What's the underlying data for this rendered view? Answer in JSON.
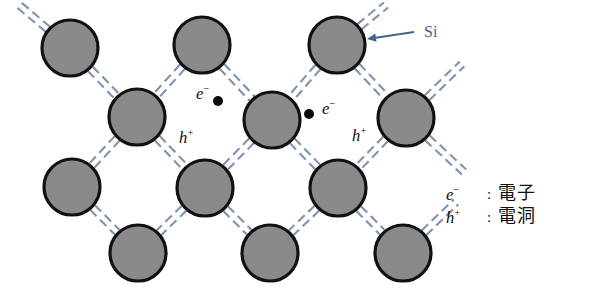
{
  "figure": {
    "background_color": "#ffffff"
  },
  "colors": {
    "atom_fill": "#8a8a8a",
    "atom_stroke": "#111111",
    "bond": "#7e92b4",
    "carrier_dot": "#0b0b0b",
    "annotation_blue": "#46638f",
    "text": "#101010"
  },
  "lattice": {
    "atom_radius": 28,
    "atoms": [
      {
        "id": "a1",
        "cx": 70,
        "cy": 48,
        "row": 1
      },
      {
        "id": "a2",
        "cx": 202,
        "cy": 45,
        "row": 1
      },
      {
        "id": "a3",
        "cx": 337,
        "cy": 45,
        "row": 1
      },
      {
        "id": "b1",
        "cx": 137,
        "cy": 117,
        "row": 2
      },
      {
        "id": "b2",
        "cx": 272,
        "cy": 120,
        "row": 2
      },
      {
        "id": "b3",
        "cx": 406,
        "cy": 118,
        "row": 2
      },
      {
        "id": "c1",
        "cx": 72,
        "cy": 187,
        "row": 3
      },
      {
        "id": "c2",
        "cx": 205,
        "cy": 188,
        "row": 3
      },
      {
        "id": "c3",
        "cx": 338,
        "cy": 188,
        "row": 3
      },
      {
        "id": "d1",
        "cx": 138,
        "cy": 253,
        "row": 4
      },
      {
        "id": "d2",
        "cx": 270,
        "cy": 253,
        "row": 4
      },
      {
        "id": "d3",
        "cx": 403,
        "cy": 253,
        "row": 4
      }
    ],
    "bonds": [
      {
        "from": "a1",
        "to": "b1"
      },
      {
        "from": "a2",
        "to": "b1"
      },
      {
        "from": "a2",
        "to": "b2"
      },
      {
        "from": "a3",
        "to": "b2"
      },
      {
        "from": "a3",
        "to": "b3"
      },
      {
        "from": "b1",
        "to": "c1"
      },
      {
        "from": "b1",
        "to": "c2"
      },
      {
        "from": "b2",
        "to": "c2"
      },
      {
        "from": "b2",
        "to": "c3"
      },
      {
        "from": "b3",
        "to": "c3"
      },
      {
        "from": "c1",
        "to": "d1"
      },
      {
        "from": "c2",
        "to": "d1"
      },
      {
        "from": "c2",
        "to": "d2"
      },
      {
        "from": "c3",
        "to": "d2"
      },
      {
        "from": "c3",
        "to": "d3"
      }
    ],
    "edge_bonds": [
      {
        "from": "a1",
        "x2": 18,
        "y2": 4
      },
      {
        "from": "a3",
        "x2": 386,
        "y2": 5
      },
      {
        "from": "b3",
        "x2": 462,
        "y2": 64
      },
      {
        "from": "b3",
        "x2": 464,
        "y2": 172
      },
      {
        "from": "d3",
        "x2": 456,
        "y2": 202
      }
    ]
  },
  "annotations": {
    "si": {
      "label": "Si",
      "color": "#46638f",
      "text_x": 424,
      "text_y": 24,
      "arrow_from_x": 414,
      "arrow_from_y": 32,
      "arrow_to_x": 367,
      "arrow_to_y": 39
    },
    "carriers": [
      {
        "id": "electron-left",
        "symbol": "e",
        "charge": "−",
        "label_x": 196,
        "label_y": 84,
        "dot_x": 218,
        "dot_y": 101,
        "dot_r": 5
      },
      {
        "id": "electron-right",
        "symbol": "e",
        "charge": "−",
        "label_x": 322,
        "label_y": 99,
        "dot_x": 309,
        "dot_y": 114,
        "dot_r": 5
      },
      {
        "id": "hole-left",
        "symbol": "h",
        "charge": "+",
        "label_x": 179,
        "label_y": 128,
        "dot_x": null,
        "dot_y": null,
        "dot_r": 0
      },
      {
        "id": "hole-right",
        "symbol": "h",
        "charge": "+",
        "label_x": 352,
        "label_y": 126,
        "dot_x": null,
        "dot_y": null,
        "dot_r": 0
      }
    ]
  },
  "legend": {
    "rows": [
      {
        "symbol": "e",
        "charge": "−",
        "colon": ":",
        "text": "電子"
      },
      {
        "symbol": "h",
        "charge": "+",
        "colon": ":",
        "text": "電洞"
      }
    ]
  }
}
